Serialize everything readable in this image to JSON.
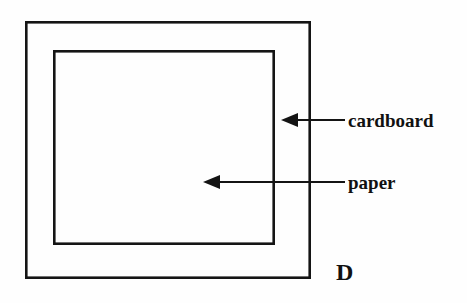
{
  "figure": {
    "panel_letter": "D",
    "background_color": "#fefefe",
    "line_color": "#141414",
    "text_color": "#111111",
    "shapes": [
      {
        "name": "cardboard-rectangle",
        "label": "cardboard",
        "x": 25,
        "y": 21,
        "width": 286,
        "height": 258,
        "stroke_width": 2.6
      },
      {
        "name": "paper-rectangle",
        "label": "paper",
        "x": 53,
        "y": 50,
        "width": 222,
        "height": 195,
        "stroke_width": 2.6
      }
    ],
    "callouts": [
      {
        "name": "cardboard-callout",
        "label": "cardboard",
        "tip_x": 281,
        "tip_y": 120,
        "tail_x": 345,
        "tail_y": 120,
        "label_x": 348,
        "label_y": 127
      },
      {
        "name": "paper-callout",
        "label": "paper",
        "tip_x": 203,
        "tip_y": 182,
        "tail_x": 345,
        "tail_y": 182,
        "label_x": 348,
        "label_y": 189
      }
    ],
    "panel_letter_position": {
      "x": 336,
      "y": 280
    }
  }
}
